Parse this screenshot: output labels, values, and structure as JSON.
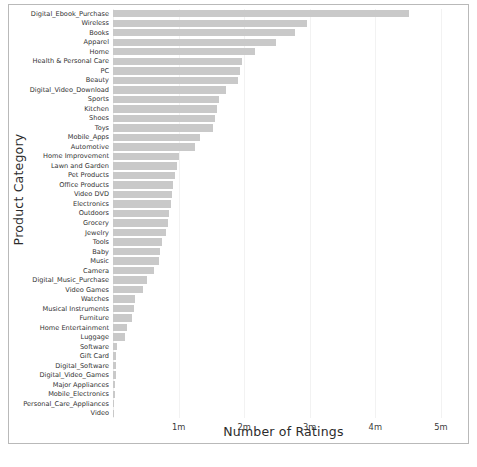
{
  "chart_data": {
    "type": "bar",
    "orientation": "horizontal",
    "title": "",
    "xlabel": "Number of Ratings",
    "ylabel": "Product Category",
    "xlim": [
      0,
      5.2
    ],
    "xtick_values": [
      1,
      2,
      3,
      4,
      5
    ],
    "xtick_labels": [
      "1m",
      "2m",
      "3m",
      "4m",
      "5m"
    ],
    "grid": true,
    "grid_axis": "x",
    "legend": "none",
    "bar_color": "#c9c9c9",
    "units": "millions of ratings",
    "categories": [
      "Digital_Ebook_Purchase",
      "Wireless",
      "Books",
      "Apparel",
      "Home",
      "Health & Personal Care",
      "PC",
      "Beauty",
      "Digital_Video_Download",
      "Sports",
      "Kitchen",
      "Shoes",
      "Toys",
      "Mobile_Apps",
      "Automotive",
      "Home Improvement",
      "Lawn and Garden",
      "Pet Products",
      "Office Products",
      "Video DVD",
      "Electronics",
      "Outdoors",
      "Grocery",
      "Jewelry",
      "Tools",
      "Baby",
      "Music",
      "Camera",
      "Digital_Music_Purchase",
      "Video Games",
      "Watches",
      "Musical Instruments",
      "Furniture",
      "Home Entertainment",
      "Luggage",
      "Software",
      "Gift Card",
      "Digital_Software",
      "Digital_Video_Games",
      "Major Appliances",
      "Mobile_Electronics",
      "Personal_Care_Appliances",
      "Video"
    ],
    "values": [
      4.52,
      2.96,
      2.78,
      2.48,
      2.17,
      1.96,
      1.93,
      1.91,
      1.72,
      1.62,
      1.58,
      1.55,
      1.53,
      1.33,
      1.25,
      1.01,
      0.98,
      0.94,
      0.91,
      0.9,
      0.88,
      0.86,
      0.84,
      0.81,
      0.75,
      0.71,
      0.7,
      0.62,
      0.52,
      0.46,
      0.33,
      0.32,
      0.29,
      0.21,
      0.18,
      0.06,
      0.05,
      0.04,
      0.04,
      0.03,
      0.03,
      0.02,
      0.02
    ]
  }
}
